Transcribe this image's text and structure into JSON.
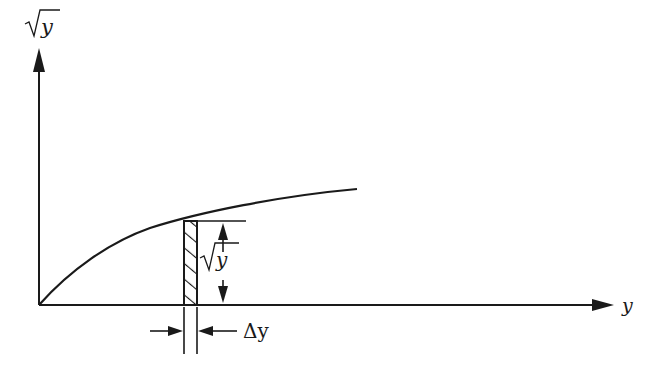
{
  "diagram": {
    "y_axis_label": "y",
    "x_axis_label": "y",
    "strip_height_label": "y",
    "strip_width_label": "Δy",
    "curve": "sqrt(y)",
    "stroke_color": "#1a1a1a",
    "background": "#ffffff"
  }
}
